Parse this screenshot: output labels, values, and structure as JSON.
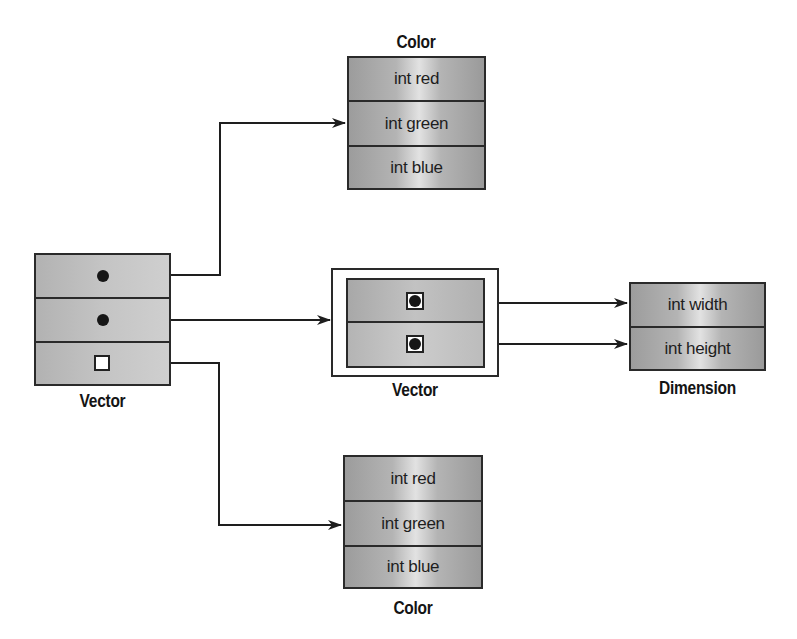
{
  "diagram": {
    "left_vector": {
      "caption": "Vector",
      "rows": [
        {
          "kind": "reference",
          "icon": "filled-dot"
        },
        {
          "kind": "reference",
          "icon": "filled-dot"
        },
        {
          "kind": "null",
          "icon": "empty-square"
        }
      ]
    },
    "top_color": {
      "caption": "Color",
      "fields": [
        "int red",
        "int green",
        "int blue"
      ]
    },
    "middle_vector": {
      "caption": "Vector",
      "rows": [
        {
          "kind": "reference",
          "icon": "boxed-dot"
        },
        {
          "kind": "reference",
          "icon": "boxed-dot"
        }
      ]
    },
    "dimension": {
      "caption": "Dimension",
      "fields": [
        "int width",
        "int height"
      ]
    },
    "bottom_color": {
      "caption": "Color",
      "fields": [
        "int red",
        "int green",
        "int blue"
      ]
    },
    "arrows": [
      {
        "from": "left_vector.row0",
        "to": "top_color.int green"
      },
      {
        "from": "left_vector.row1",
        "to": "middle_vector"
      },
      {
        "from": "left_vector.row2",
        "to": "bottom_color.int green"
      },
      {
        "from": "middle_vector.row0",
        "to": "dimension.int width"
      },
      {
        "from": "middle_vector.row1",
        "to": "dimension.int height"
      }
    ],
    "colors": {
      "line": "#1e1e1e",
      "box_fill": "#b4b4b4",
      "box_highlight": "#e2e2e2",
      "background": "#ffffff"
    }
  }
}
